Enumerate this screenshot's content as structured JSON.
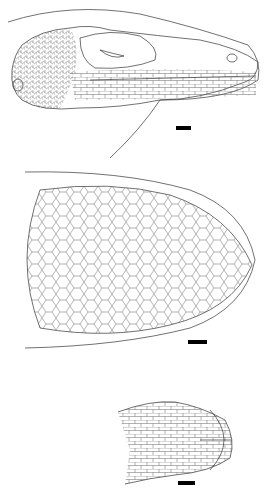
{
  "figure": {
    "panels": [
      {
        "id": "lateral",
        "view": "lateral view of head",
        "scale_bar": true
      },
      {
        "id": "dorsal",
        "view": "dorsal view of head",
        "scale_bar": true
      },
      {
        "id": "ventral",
        "view": "ventral view of head",
        "scale_bar": true
      }
    ],
    "colors": {
      "line": "#333333",
      "background": "#ffffff",
      "scale_bar": "#000000"
    }
  }
}
